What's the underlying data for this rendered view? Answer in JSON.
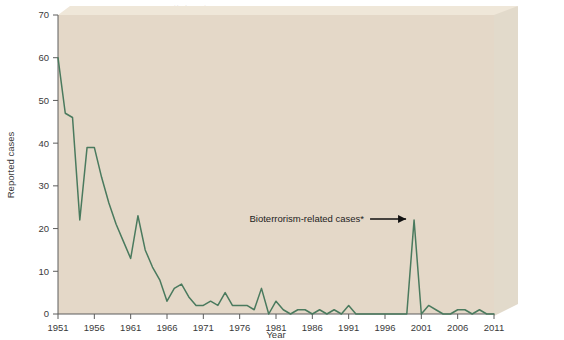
{
  "figure": {
    "background_color": "#ffffff",
    "plot_background_color": "#e4d8c8",
    "slab_top_color": "#efe7d9",
    "slab_side_color": "#e2dacb",
    "line_color": "#4a7a5e",
    "axis_color": "#5c5c5c",
    "text_color": "#3a3a3a"
  },
  "annotation": {
    "label": "Bioterrorism-related cases*"
  },
  "chart_data": {
    "type": "line",
    "title": "",
    "subtitle": "",
    "xlabel": "Year",
    "ylabel": "Reported cases",
    "xlim": [
      1951,
      2011
    ],
    "ylim": [
      0,
      70
    ],
    "ytick_labels": [
      "0",
      "10",
      "20",
      "30",
      "40",
      "50",
      "60",
      "70"
    ],
    "yticks": [
      0,
      10,
      20,
      30,
      40,
      50,
      60,
      70
    ],
    "xtick_labels": [
      "1951",
      "1956",
      "1961",
      "1966",
      "1971",
      "1976",
      "1981",
      "1986",
      "1991",
      "1996",
      "2001",
      "2006",
      "2011"
    ],
    "xticks": [
      1951,
      1956,
      1961,
      1966,
      1971,
      1976,
      1981,
      1986,
      1991,
      1996,
      2001,
      2006,
      2011
    ],
    "grid": false,
    "legend": "none",
    "series": [
      {
        "name": "Reported anthrax cases",
        "color": "#4a7a5e",
        "x": [
          1951,
          1952,
          1953,
          1954,
          1955,
          1956,
          1957,
          1958,
          1959,
          1960,
          1961,
          1962,
          1963,
          1964,
          1965,
          1966,
          1967,
          1968,
          1969,
          1970,
          1971,
          1972,
          1973,
          1974,
          1975,
          1976,
          1977,
          1978,
          1979,
          1980,
          1981,
          1982,
          1983,
          1984,
          1985,
          1986,
          1987,
          1988,
          1989,
          1990,
          1991,
          1992,
          1993,
          1994,
          1995,
          1996,
          1997,
          1998,
          1999,
          2000,
          2001,
          2002,
          2003,
          2004,
          2005,
          2006,
          2007,
          2008,
          2009,
          2010,
          2011
        ],
        "values": [
          60,
          47,
          46,
          22,
          39,
          39,
          32,
          26,
          21,
          17,
          13,
          23,
          15,
          11,
          8,
          3,
          6,
          7,
          4,
          2,
          2,
          3,
          2,
          5,
          2,
          2,
          2,
          1,
          6,
          0,
          3,
          1,
          0,
          1,
          1,
          0,
          1,
          0,
          1,
          0,
          2,
          0,
          0,
          0,
          0,
          0,
          0,
          0,
          0,
          22,
          0,
          2,
          1,
          0,
          0,
          1,
          1,
          0,
          1,
          0,
          0
        ]
      }
    ],
    "annotations": [
      {
        "text": "Bioterrorism-related cases*",
        "points_to_x": 2000,
        "points_to_y": 22
      }
    ]
  },
  "ghost_text": {
    "lines": [
      "as an occupational disease",
      "of workers handling animal",
      "hides and wool. The number",
      "of cases reported each year",
      "has declined markedly since",
      "the 1950s. In 2001, a cluster",
      "of cases resulted from the",
      "deliberate release of spores",
      "through the mail system.",
      "INFECTIOUS DISEASES",
      "Bacterial Diseases"
    ]
  }
}
